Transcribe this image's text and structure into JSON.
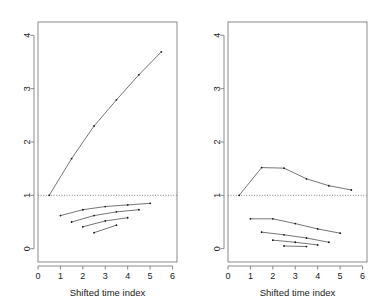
{
  "figure": {
    "background": "#ffffff",
    "line_color": "#3a3a3a",
    "point_color": "#1a1a1a",
    "axis_color": "#6e6e6e",
    "reference_line_color": "#7a7a7a",
    "panel_count": 2
  },
  "chart_data": [
    {
      "type": "line",
      "panel": "left",
      "title": "",
      "xlabel": "Shifted time index",
      "ylabel": "",
      "xlim": [
        0,
        6.2
      ],
      "ylim": [
        -0.25,
        4.25
      ],
      "xticks": [
        0,
        1,
        2,
        3,
        4,
        5,
        6
      ],
      "xticklabels": [
        "0",
        "1",
        "2",
        "3",
        "4",
        "5",
        "6"
      ],
      "yticks": [
        0,
        1,
        2,
        3,
        4
      ],
      "yticklabels": [
        "0",
        "1",
        "2",
        "3",
        "4"
      ],
      "grid": false,
      "legend": "none",
      "reference_lines": [
        {
          "axis": "y",
          "value": 1,
          "style": "dotted"
        }
      ],
      "series": [
        {
          "name": "upper-trend",
          "marker": "point",
          "x": [
            0.5,
            1.5,
            2.5,
            3.5,
            4.5,
            5.5
          ],
          "y": [
            1.0,
            1.69,
            2.3,
            2.79,
            3.26,
            3.69
          ]
        },
        {
          "name": "lower-cohort-1",
          "marker": "point",
          "x": [
            1.0,
            2.0,
            3.0,
            4.0,
            5.0
          ],
          "y": [
            0.62,
            0.73,
            0.79,
            0.82,
            0.85
          ]
        },
        {
          "name": "lower-cohort-2",
          "marker": "point",
          "x": [
            1.5,
            2.5,
            3.5,
            4.5
          ],
          "y": [
            0.5,
            0.62,
            0.69,
            0.73
          ]
        },
        {
          "name": "lower-cohort-3",
          "marker": "point",
          "x": [
            2.0,
            3.0,
            4.0
          ],
          "y": [
            0.41,
            0.52,
            0.58
          ]
        },
        {
          "name": "lower-cohort-4",
          "marker": "point",
          "x": [
            2.5,
            3.5
          ],
          "y": [
            0.3,
            0.44
          ]
        }
      ]
    },
    {
      "type": "line",
      "panel": "right",
      "title": "",
      "xlabel": "Shifted time index",
      "ylabel": "",
      "xlim": [
        0,
        6.2
      ],
      "ylim": [
        -0.25,
        4.25
      ],
      "xticks": [
        0,
        1,
        2,
        3,
        4,
        5,
        6
      ],
      "xticklabels": [
        "0",
        "1",
        "2",
        "3",
        "4",
        "5",
        "6"
      ],
      "yticks": [
        0,
        1,
        2,
        3,
        4
      ],
      "yticklabels": [
        "0",
        "1",
        "2",
        "3",
        "4"
      ],
      "grid": false,
      "legend": "none",
      "reference_lines": [
        {
          "axis": "y",
          "value": 1,
          "style": "dotted"
        }
      ],
      "series": [
        {
          "name": "upper-trend",
          "marker": "point",
          "x": [
            0.5,
            1.5,
            2.5,
            3.5,
            4.5,
            5.5
          ],
          "y": [
            1.0,
            1.52,
            1.51,
            1.31,
            1.18,
            1.1
          ]
        },
        {
          "name": "lower-cohort-1",
          "marker": "point",
          "x": [
            1.0,
            2.0,
            3.0,
            4.0,
            5.0
          ],
          "y": [
            0.56,
            0.56,
            0.47,
            0.37,
            0.29
          ]
        },
        {
          "name": "lower-cohort-2",
          "marker": "point",
          "x": [
            1.5,
            2.5,
            3.5,
            4.5
          ],
          "y": [
            0.31,
            0.26,
            0.2,
            0.12
          ]
        },
        {
          "name": "lower-cohort-3",
          "marker": "point",
          "x": [
            2.0,
            3.0,
            4.0
          ],
          "y": [
            0.16,
            0.12,
            0.07
          ]
        },
        {
          "name": "lower-cohort-4",
          "marker": "point",
          "x": [
            2.5,
            3.5
          ],
          "y": [
            0.05,
            0.04
          ]
        }
      ]
    }
  ],
  "panels": {
    "left": {
      "xlabel": "Shifted time index",
      "xticklabels": [
        "0",
        "1",
        "2",
        "3",
        "4",
        "5",
        "6"
      ],
      "yticklabels": [
        "0",
        "1",
        "2",
        "3",
        "4"
      ]
    },
    "right": {
      "xlabel": "Shifted time index",
      "xticklabels": [
        "0",
        "1",
        "2",
        "3",
        "4",
        "5",
        "6"
      ],
      "yticklabels": [
        "0",
        "1",
        "2",
        "3",
        "4"
      ]
    }
  }
}
